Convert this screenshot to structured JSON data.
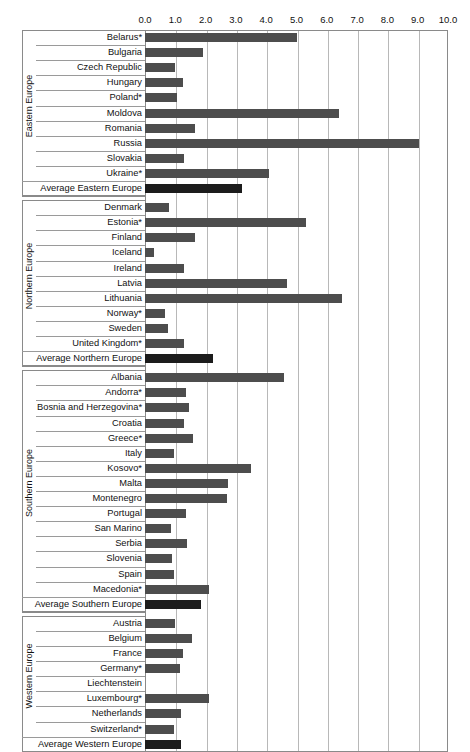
{
  "chart_data": {
    "type": "bar",
    "orientation": "horizontal",
    "title": "",
    "xlabel": "",
    "ylabel": "",
    "xlim": [
      0.0,
      10.0
    ],
    "grid": true,
    "legend": "none",
    "xticks": [
      "0.0",
      "1.0",
      "2.0",
      "3.0",
      "4.0",
      "5.0",
      "6.0",
      "7.0",
      "8.0",
      "9.0",
      "10.0"
    ],
    "xtick_values": [
      0,
      1,
      2,
      3,
      4,
      5,
      6,
      7,
      8,
      9,
      10
    ],
    "groups": [
      {
        "name": "Eastern Europe",
        "categories": [
          "Belarus*",
          "Bulgaria",
          "Czech Republic",
          "Hungary",
          "Poland*",
          "Moldova",
          "Romania",
          "Russia",
          "Slovakia",
          "Ukraine*",
          "Average Eastern Europe"
        ],
        "values": [
          5.0,
          1.9,
          1.0,
          1.25,
          1.05,
          6.4,
          1.65,
          9.05,
          1.3,
          4.1,
          3.2
        ],
        "average_index": 10
      },
      {
        "name": "Northern Europe",
        "categories": [
          "Denmark",
          "Estonia*",
          "Finland",
          "Iceland",
          "Ireland",
          "Latvia",
          "Lithuania",
          "Norway*",
          "Sweden",
          "United Kingdom*",
          "Average Northern Europe"
        ],
        "values": [
          0.8,
          5.3,
          1.65,
          0.3,
          1.3,
          4.7,
          6.5,
          0.65,
          0.75,
          1.3,
          2.25
        ],
        "average_index": 10
      },
      {
        "name": "Southern Europe",
        "categories": [
          "Albania",
          "Andorra*",
          "Bosnia and Herzegovina*",
          "Croatia",
          "Greece*",
          "Italy",
          "Kosovo*",
          "Malta",
          "Montenegro",
          "Portugal",
          "San Marino",
          "Serbia",
          "Slovenia",
          "Spain",
          "Macedonia*",
          "Average Southern Europe"
        ],
        "values": [
          4.6,
          1.35,
          1.45,
          1.3,
          1.6,
          0.95,
          3.5,
          2.75,
          2.7,
          1.35,
          0.85,
          1.4,
          0.9,
          0.95,
          2.1,
          1.85
        ],
        "average_index": 15
      },
      {
        "name": "Western Europe",
        "categories": [
          "Austria",
          "Belgium",
          "France",
          "Germany*",
          "Liechtenstein",
          "Luxembourg*",
          "Netherlands",
          "Switzerland*",
          "Average Western Europe"
        ],
        "values": [
          1.0,
          1.55,
          1.25,
          1.15,
          0.0,
          2.1,
          1.2,
          0.95,
          1.2
        ],
        "average_index": 8
      }
    ],
    "colors": {
      "bar": "#4d4d4d",
      "average_bar": "#1c1c1c",
      "gridline": "#b8b8b8",
      "frame": "#8a8a8a",
      "text": "#111111"
    }
  }
}
